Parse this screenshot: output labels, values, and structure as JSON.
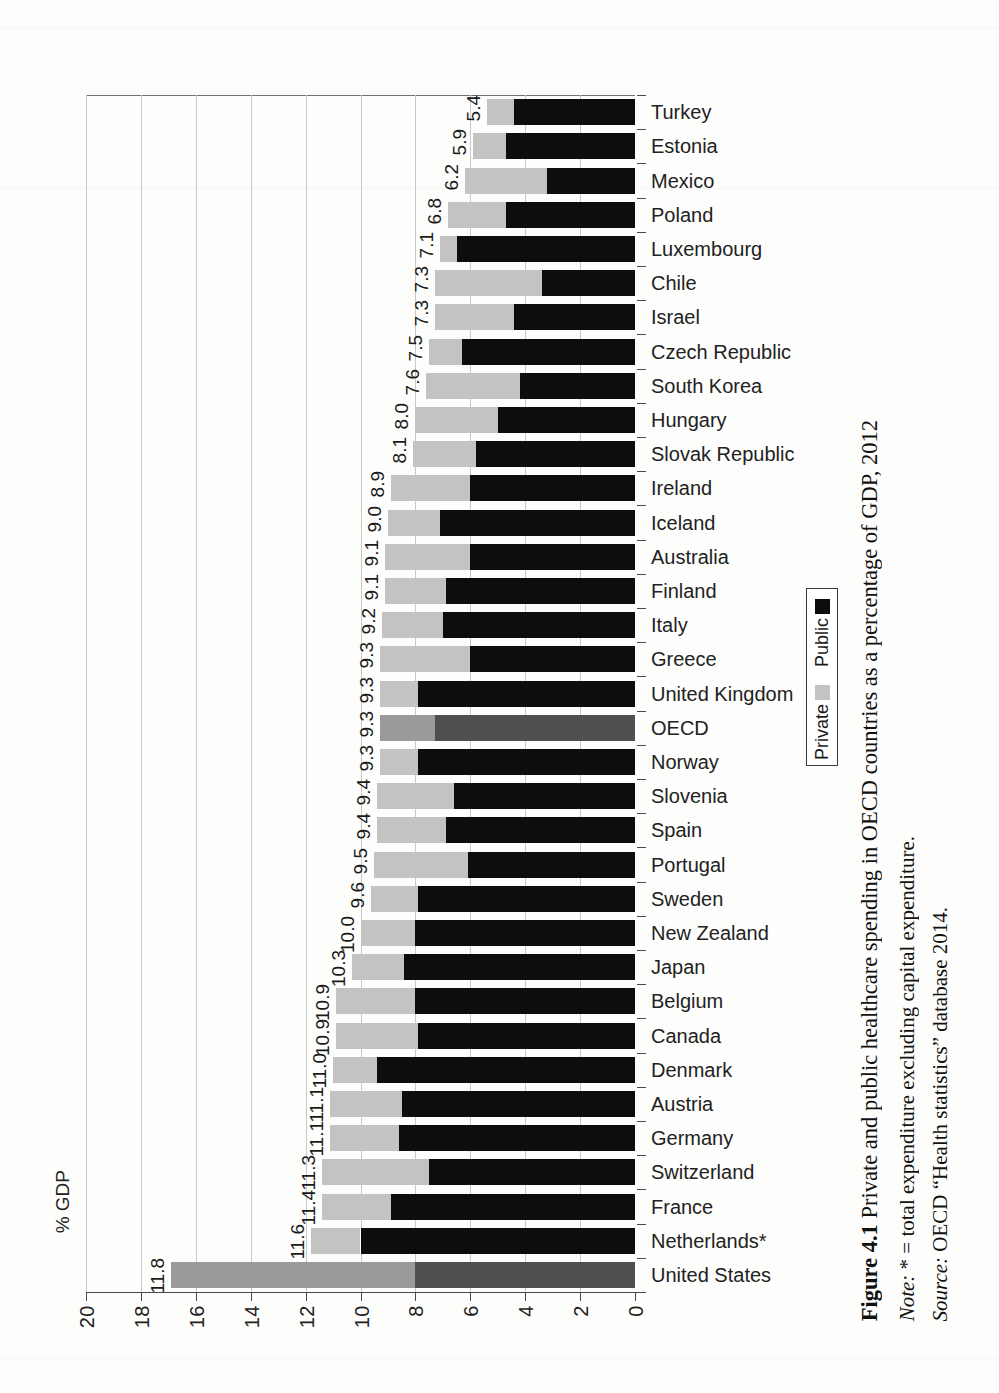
{
  "figure": {
    "label": "Figure 4.1",
    "title": "Private and public healthcare spending in OECD countries as a percentage of GDP, 2012",
    "note_prefix": "Note:",
    "note_text": " * = total expenditure excluding capital expenditure.",
    "source_prefix": "Source:",
    "source_text": " OECD “Health statistics” database 2014."
  },
  "legend": {
    "title": "",
    "items": [
      {
        "label": "Public",
        "color": "#0d0d0d"
      },
      {
        "label": "Private",
        "color": "#c3c3c3"
      }
    ]
  },
  "axis": {
    "value_axis_title": "% GDP",
    "value_ticks": [
      "20",
      "18",
      "16",
      "14",
      "12",
      "10",
      "8",
      "6",
      "4",
      "2",
      "0"
    ]
  },
  "chart_data": {
    "type": "bar",
    "orientation": "horizontal-stacked",
    "title": "Private and public healthcare spending in OECD countries as a percentage of GDP, 2012",
    "xlabel": "% GDP",
    "ylabel": "",
    "xlim": [
      0,
      20
    ],
    "xticks": [
      0,
      2,
      4,
      6,
      8,
      10,
      12,
      14,
      16,
      18,
      20
    ],
    "x_axis_reversed": true,
    "grid": true,
    "legend_position": "right",
    "categories": [
      "Turkey",
      "Estonia",
      "Mexico",
      "Poland",
      "Luxembourg",
      "Chile",
      "Israel",
      "Czech Republic",
      "South Korea",
      "Hungary",
      "Slovak Republic",
      "Ireland",
      "Iceland",
      "Australia",
      "Finland",
      "Italy",
      "Greece",
      "United Kingdom",
      "OECD",
      "Norway",
      "Slovenia",
      "Spain",
      "Portugal",
      "Sweden",
      "New Zealand",
      "Japan",
      "Belgium",
      "Canada",
      "Denmark",
      "Austria",
      "Germany",
      "Switzerland",
      "France",
      "Netherlands*",
      "United States"
    ],
    "totals": [
      5.4,
      5.9,
      6.2,
      6.8,
      7.1,
      7.3,
      7.3,
      7.5,
      7.6,
      8.0,
      8.1,
      8.9,
      9.0,
      9.1,
      9.1,
      9.2,
      9.3,
      9.3,
      9.3,
      9.3,
      9.4,
      9.4,
      9.5,
      9.6,
      10.0,
      10.3,
      10.9,
      10.9,
      11.0,
      11.1,
      11.1,
      11.3,
      11.4,
      11.6,
      11.8,
      16.9
    ],
    "series": [
      {
        "name": "Public",
        "values": [
          4.4,
          4.7,
          3.2,
          4.7,
          6.5,
          3.4,
          4.4,
          6.3,
          4.2,
          5.0,
          5.8,
          6.0,
          7.1,
          6.0,
          6.9,
          7.0,
          6.0,
          7.9,
          7.3,
          7.9,
          6.6,
          6.9,
          6.1,
          7.9,
          8.0,
          8.4,
          8.0,
          7.9,
          9.4,
          8.5,
          8.6,
          7.5,
          8.9,
          10.0,
          8.0
        ]
      },
      {
        "name": "Private",
        "values": [
          1.0,
          1.2,
          3.0,
          2.1,
          0.6,
          3.9,
          2.9,
          1.2,
          3.4,
          3.0,
          2.3,
          2.9,
          1.9,
          3.1,
          2.2,
          2.2,
          3.3,
          1.4,
          2.0,
          1.4,
          2.8,
          2.5,
          3.4,
          1.7,
          2.0,
          1.9,
          2.9,
          3.0,
          1.6,
          2.6,
          2.5,
          3.9,
          2.5,
          1.8,
          8.9
        ]
      }
    ],
    "data_labels": [
      "5.4",
      "5.9",
      "6.2",
      "6.8",
      "7.1",
      "7.3",
      "7.3",
      "7.5",
      "7.6",
      "8.0",
      "8.1",
      "8.9",
      "9.0",
      "9.1",
      "9.1",
      "9.2",
      "9.3",
      "9.3",
      "9.3",
      "9.3",
      "9.4",
      "9.4",
      "9.5",
      "9.6",
      "10.0",
      "10.3",
      "10.9",
      "10.9",
      "11.0",
      "11.1",
      "11.1",
      "11.3",
      "11.4",
      "11.6",
      "11.8",
      "16.9"
    ],
    "highlighted_rows": [
      "OECD",
      "United States"
    ]
  }
}
